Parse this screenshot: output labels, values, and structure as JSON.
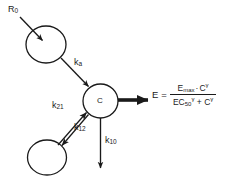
{
  "diagram": {
    "stroke_color": "#1a1a1a",
    "fill_color": "#ffffff",
    "nodes": [
      {
        "id": "depot",
        "label": "",
        "name": "depot-compartment"
      },
      {
        "id": "central",
        "label": "C",
        "name": "central-compartment"
      },
      {
        "id": "peripheral",
        "label": "",
        "name": "peripheral-compartment"
      }
    ],
    "labels": {
      "dose_input": "R",
      "dose_input_sub": "0",
      "ka": "k",
      "ka_sub": "a",
      "k21": "k",
      "k21_sub": "21",
      "k12": "k",
      "k12_sub": "12",
      "k10": "k",
      "k10_sub": "10",
      "central_node": "C"
    },
    "equation": {
      "lhs": "E",
      "eq_sign": "=",
      "numerator": {
        "term1_base": "E",
        "term1_sub": "max",
        "operator": "·",
        "term2_base": "C",
        "term2_sup": "γ"
      },
      "denominator": {
        "term1_base": "EC",
        "term1_sub": "50",
        "term1_sup": "γ",
        "operator": "+",
        "term2_base": "C",
        "term2_sup": "γ"
      }
    }
  }
}
